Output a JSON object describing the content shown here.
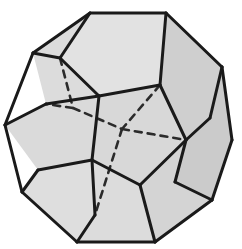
{
  "figure": {
    "name": "dodecahedron",
    "title": "Regular dodecahedron",
    "projection": "oblique",
    "solid_type": "regular dodecahedron",
    "face_count": 12,
    "vertex_count": 20,
    "edge_count": 30,
    "face_shape": "pentagon",
    "background_color": "#ffffff",
    "visible_face_fill": "#d9d9d9",
    "shaded_face_fill": "#cccccc",
    "bright_face_fill": "#e2e2e2",
    "edge_color": "#1a1a1a",
    "hidden_edge_color": "#2b2b2b",
    "edge_width": 3.0,
    "hidden_edge_width": 2.6,
    "hidden_edge_dash": "7 6",
    "artifact_left": "o",
    "artifact_right": "o",
    "outline": [
      [
        90,
        13
      ],
      [
        166,
        13
      ],
      [
        222,
        67
      ],
      [
        232,
        140
      ],
      [
        212,
        200
      ],
      [
        155,
        242
      ],
      [
        77,
        242
      ],
      [
        22,
        192
      ],
      [
        5,
        125
      ],
      [
        33,
        53
      ]
    ],
    "faces": [
      {
        "name": "face-top",
        "fill": "#e2e2e2",
        "points": "90,13 166,13 160,85 99,96 60,58"
      },
      {
        "name": "face-upper-left",
        "fill": "#dcdcdc",
        "points": "33,53 90,13 60,58 99,96 46,104"
      },
      {
        "name": "face-left",
        "fill": "#dadada",
        "points": "5,125 46,104 99,96 92,160 38,170"
      },
      {
        "name": "face-lower-left",
        "fill": "#dedede",
        "points": "22,192 38,170 92,160 95,215 77,242"
      },
      {
        "name": "face-center",
        "fill": "#d8d8d8",
        "points": "99,96 160,85 186,140 140,185 92,160"
      },
      {
        "name": "face-upper-right",
        "fill": "#cfcfcf",
        "points": "166,13 222,67 210,118 186,140 160,85"
      },
      {
        "name": "face-right",
        "fill": "#cbcbcb",
        "points": "222,67 232,140 212,200 175,182 186,140 210,118"
      },
      {
        "name": "face-bottom",
        "fill": "#dcdcdc",
        "points": "92,160 140,185 155,242 77,242 95,215"
      },
      {
        "name": "face-lower-right",
        "fill": "#d4d4d4",
        "points": "140,185 186,140 175,182 212,200 155,242"
      }
    ],
    "visible_edges": [
      "90,13 166,13",
      "166,13 222,67",
      "222,67 232,140",
      "232,140 212,200",
      "212,200 155,242",
      "155,242 77,242",
      "77,242 22,192",
      "22,192 5,125",
      "5,125 33,53",
      "33,53 90,13",
      "90,13 60,58",
      "60,58 99,96",
      "99,96 160,85",
      "160,85 166,13",
      "60,58 33,53",
      "99,96 46,104",
      "46,104 5,125",
      "99,96 92,160",
      "92,160 38,170",
      "38,170 22,192",
      "92,160 95,215",
      "95,215 77,242",
      "160,85 186,140",
      "186,140 210,118",
      "210,118 222,67",
      "186,140 175,182",
      "175,182 212,200",
      "186,140 140,185",
      "140,185 92,160",
      "140,185 155,242"
    ],
    "hidden_edges": [
      "60,58 73,108",
      "73,108 46,104",
      "73,108 122,129",
      "122,129 186,140",
      "122,129 95,215",
      "160,85 122,129"
    ]
  }
}
